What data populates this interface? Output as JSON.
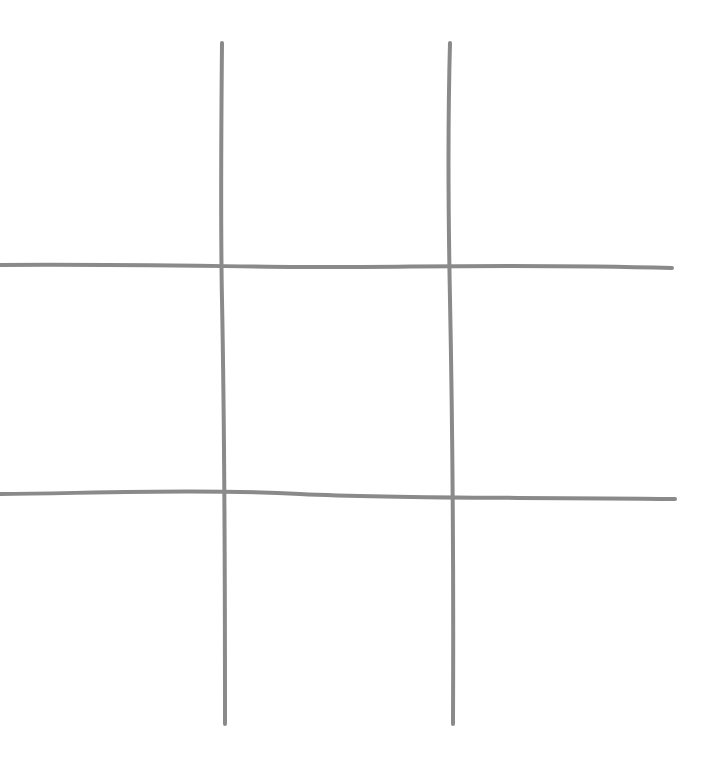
{
  "game": {
    "name": "tic-tac-toe",
    "board": [
      [
        "",
        "",
        ""
      ],
      [
        "",
        "",
        ""
      ],
      [
        "",
        "",
        ""
      ]
    ],
    "line_color": "#8a8a8a",
    "background": "#ffffff"
  }
}
